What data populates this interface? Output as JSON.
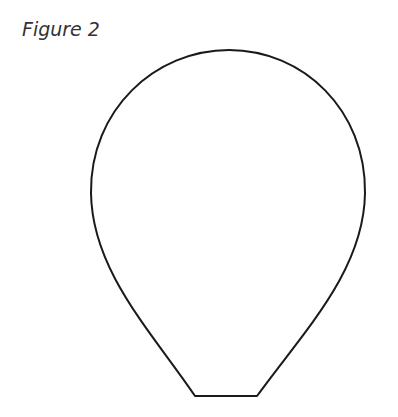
{
  "figure": {
    "caption": "Figure 2",
    "shape": "balloon-outline",
    "stroke_color": "#1a1a1a",
    "fill_color": "#ffffff"
  }
}
